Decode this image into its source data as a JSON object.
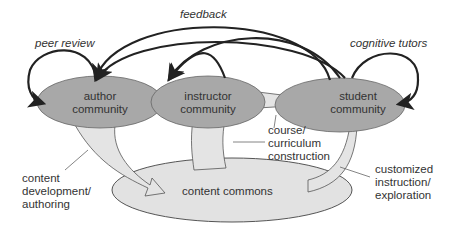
{
  "nodes": {
    "author": {
      "line1": "author",
      "line2": "community"
    },
    "instructor": {
      "line1": "instructor",
      "line2": "community"
    },
    "student": {
      "line1": "student",
      "line2": "community"
    },
    "commons": {
      "label": "content commons"
    }
  },
  "edges": {
    "feedback": "feedback",
    "peer_review": "peer review",
    "cognitive_tutors": "cognitive tutors",
    "course1": "course/",
    "course2": "curriculum",
    "course3": "construction",
    "content1": "content",
    "content2": "development/",
    "content3": "authoring",
    "custom1": "customized",
    "custom2": "instruction/",
    "custom3": "exploration"
  },
  "colors": {
    "community": "#a8a8a8",
    "commons": "#e2e2e2",
    "arrow_fill": "#e4e4e4",
    "stroke": "#222222"
  }
}
